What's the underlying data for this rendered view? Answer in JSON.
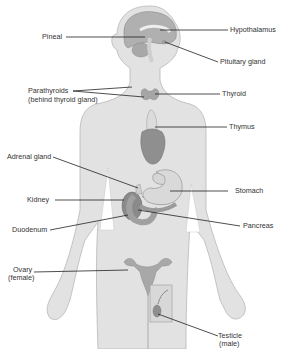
{
  "diagram": {
    "type": "anatomical-illustration",
    "colors": {
      "body_fill": "#e2e2e2",
      "body_stroke": "#b8b8b8",
      "organ_dark": "#7a7a7a",
      "organ_mid": "#a9a9a9",
      "organ_light": "#d0d0d0",
      "leader_line": "#222222",
      "label_text": "#333333"
    }
  },
  "labels": {
    "pineal": "Pineal",
    "hypothalamus": "Hypothalamus",
    "pituitary": "Pituitary gland",
    "parathyroids_1": "Parathyroids",
    "parathyroids_2": "(behind thyroid gland)",
    "thyroid": "Thyroid",
    "thymus": "Thymus",
    "adrenal": "Adrenal gland",
    "stomach": "Stomach",
    "kidney": "Kidney",
    "pancreas": "Pancreas",
    "duodenum": "Duodenum",
    "ovary_1": "Ovary",
    "ovary_2": "(female)",
    "testicle_1": "Testicle",
    "testicle_2": "(male)"
  }
}
